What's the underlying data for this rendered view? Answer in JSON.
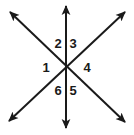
{
  "figure": {
    "background_color": "#ffffff",
    "stroke_color": "#1a1a1a",
    "stroke_width": 2,
    "center": {
      "x": 66,
      "y": 67
    },
    "lines": [
      {
        "name": "vertical-line",
        "x1": 66,
        "y1": 6,
        "x2": 66,
        "y2": 128,
        "arrowheads": "both"
      },
      {
        "name": "diagonal-line-nwse",
        "x1": 10,
        "y1": 12,
        "x2": 125,
        "y2": 122,
        "arrowheads": "both"
      },
      {
        "name": "diagonal-line-swne",
        "x1": 9,
        "y1": 121,
        "x2": 125,
        "y2": 12,
        "arrowheads": "both"
      }
    ],
    "labels": [
      {
        "id": "1",
        "text": "1",
        "x": 46,
        "y": 68
      },
      {
        "id": "2",
        "text": "2",
        "x": 58,
        "y": 44
      },
      {
        "id": "3",
        "text": "3",
        "x": 73,
        "y": 44
      },
      {
        "id": "4",
        "text": "4",
        "x": 87,
        "y": 68
      },
      {
        "id": "5",
        "text": "5",
        "x": 73,
        "y": 91
      },
      {
        "id": "6",
        "text": "6",
        "x": 58,
        "y": 91
      }
    ]
  }
}
